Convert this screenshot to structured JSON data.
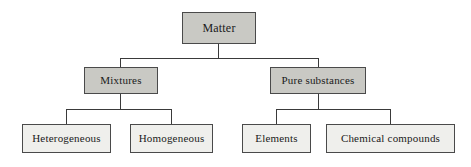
{
  "diagram": {
    "type": "hierarchy-tree",
    "orientation": "top-down",
    "colors": {
      "background": "#ffffff",
      "tier_dark_fill": "#c9c9c4",
      "tier_light_fill": "#efefec",
      "border": "#4a4a4a",
      "shadow": "#a9a9a4",
      "connector": "#3a3a3a",
      "text": "#1a1a1a"
    },
    "nodes": {
      "matter": {
        "label": "Matter",
        "tier": 1
      },
      "mixtures": {
        "label": "Mixtures",
        "tier": 2
      },
      "pure_substances": {
        "label": "Pure substances",
        "tier": 2
      },
      "heterogeneous": {
        "label": "Heterogeneous",
        "tier": 3
      },
      "homogeneous": {
        "label": "Homogeneous",
        "tier": 3
      },
      "elements": {
        "label": "Elements",
        "tier": 3
      },
      "chemical_compounds": {
        "label": "Chemical compounds",
        "tier": 3
      }
    },
    "edges": [
      {
        "from": "matter",
        "to": "mixtures"
      },
      {
        "from": "matter",
        "to": "pure_substances"
      },
      {
        "from": "mixtures",
        "to": "heterogeneous"
      },
      {
        "from": "mixtures",
        "to": "homogeneous"
      },
      {
        "from": "pure_substances",
        "to": "elements"
      },
      {
        "from": "pure_substances",
        "to": "chemical_compounds"
      }
    ]
  }
}
